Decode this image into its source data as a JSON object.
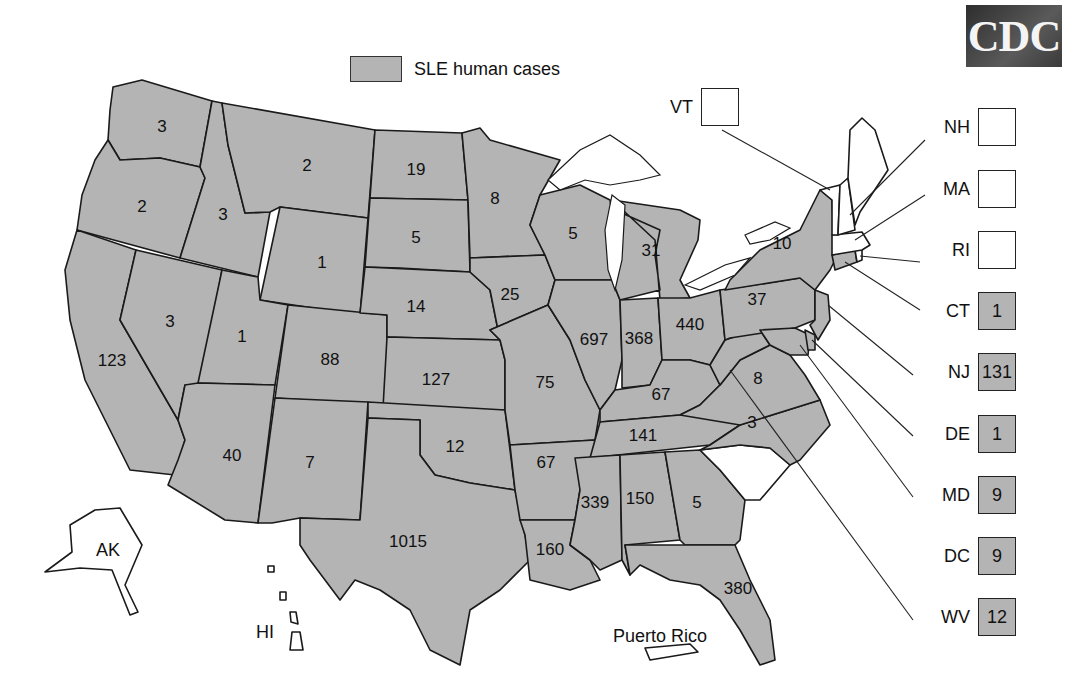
{
  "logo": {
    "text": "CDC"
  },
  "legend": {
    "label": "SLE human cases",
    "swatch_color": "#b4b4b4"
  },
  "colors": {
    "reported": "#b4b4b4",
    "none": "#ffffff",
    "border": "#1a1a1a"
  },
  "state_values": {
    "WA": "3",
    "OR": "2",
    "CA": "123",
    "ID": "3",
    "NV": "3",
    "MT": "2",
    "WY": "1",
    "UT": "1",
    "AZ": "40",
    "CO": "88",
    "NM": "7",
    "ND": "19",
    "SD": "5",
    "NE": "14",
    "KS": "127",
    "OK": "12",
    "TX": "1015",
    "MN": "8",
    "IA": "25",
    "MO": "75",
    "AR": "67",
    "LA": "160",
    "WI": "5",
    "IL": "697",
    "MI": "31",
    "IN": "368",
    "OH": "440",
    "KY": "67",
    "TN": "141",
    "MS": "339",
    "AL": "150",
    "GA": "5",
    "FL": "380",
    "NY": "10",
    "PA": "37",
    "VA": "8",
    "NC": "3"
  },
  "territory_labels": {
    "AK": "AK",
    "HI": "HI",
    "PR": "Puerto Rico"
  },
  "callouts": [
    {
      "abbr": "VT",
      "value": ""
    },
    {
      "abbr": "NH",
      "value": ""
    },
    {
      "abbr": "MA",
      "value": ""
    },
    {
      "abbr": "RI",
      "value": ""
    },
    {
      "abbr": "CT",
      "value": "1"
    },
    {
      "abbr": "NJ",
      "value": "131"
    },
    {
      "abbr": "DE",
      "value": "1"
    },
    {
      "abbr": "MD",
      "value": "9"
    },
    {
      "abbr": "DC",
      "value": "9"
    },
    {
      "abbr": "WV",
      "value": "12"
    }
  ]
}
